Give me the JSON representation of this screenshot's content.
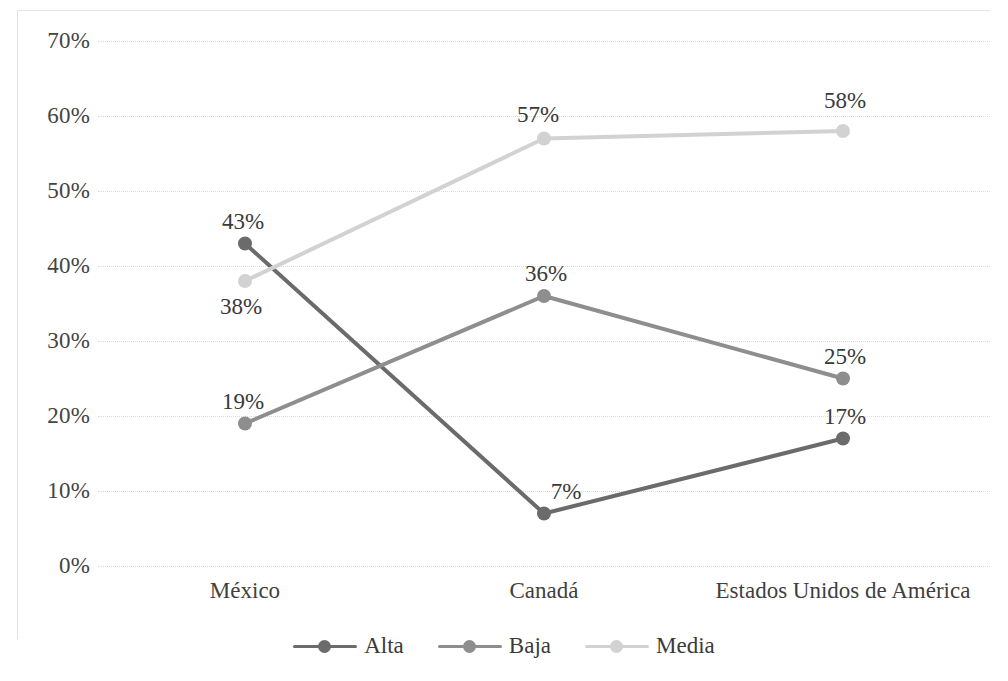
{
  "chart_data": {
    "type": "line",
    "title": "",
    "subtitle": "",
    "xlabel": "",
    "ylabel": "",
    "categories": [
      "México",
      "Canadá",
      "Estados Unidos de América"
    ],
    "series": [
      {
        "name": "Alta",
        "color": "#6b6b6b",
        "values": [
          43,
          7,
          17
        ],
        "labels": [
          "43%",
          "7%",
          "17%"
        ]
      },
      {
        "name": "Baja",
        "color": "#8e8e8e",
        "values": [
          19,
          36,
          25
        ],
        "labels": [
          "19%",
          "36%",
          "25%"
        ]
      },
      {
        "name": "Media",
        "color": "#d2d2d2",
        "values": [
          38,
          57,
          58
        ],
        "labels": [
          "38%",
          "57%",
          "58%"
        ]
      }
    ],
    "ylim": [
      0,
      70
    ],
    "ytick_step": 10,
    "ytick_labels": [
      "70%",
      "60%",
      "50%",
      "40%",
      "30%",
      "20%",
      "10%",
      "0%"
    ],
    "ytick_values": [
      70,
      60,
      50,
      40,
      30,
      20,
      10,
      0
    ],
    "grid": true,
    "grid_color": "#dcdcdc",
    "legend_position": "bottom",
    "marker": "circle",
    "value_labels": true
  },
  "legend": {
    "items": [
      {
        "label": "Alta",
        "color": "#6b6b6b"
      },
      {
        "label": "Baja",
        "color": "#8e8e8e"
      },
      {
        "label": "Media",
        "color": "#d2d2d2"
      }
    ]
  }
}
